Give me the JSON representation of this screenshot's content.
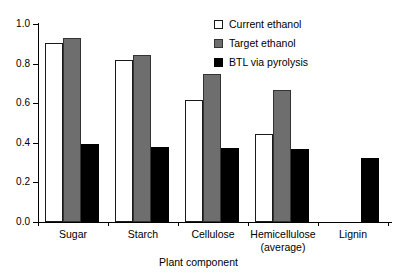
{
  "chart_data": {
    "type": "bar",
    "title": "",
    "xlabel": "Plant component",
    "ylabel": "",
    "ylim": [
      0.0,
      1.0
    ],
    "yticks": [
      "0.0",
      "0.2",
      "0.4",
      "0.6",
      "0.8",
      "1.0"
    ],
    "ytick_values": [
      0.0,
      0.2,
      0.4,
      0.6,
      0.8,
      1.0
    ],
    "grid": false,
    "legend_position": "top-right",
    "categories": [
      "Sugar",
      "Starch",
      "Cellulose",
      "Hemicellulose",
      "Lignin"
    ],
    "category_sublabels": [
      "",
      "",
      "",
      "(average)",
      ""
    ],
    "series": [
      {
        "name": "Current ethanol",
        "color": "#ffffff",
        "values": [
          0.905,
          0.82,
          0.615,
          0.445,
          null
        ]
      },
      {
        "name": "Target ethanol",
        "color": "#6e6e6e",
        "values": [
          0.93,
          0.845,
          0.75,
          0.665,
          null
        ]
      },
      {
        "name": "BTL via pyrolysis",
        "color": "#000000",
        "values": [
          0.395,
          0.38,
          0.375,
          0.37,
          0.325
        ]
      }
    ]
  },
  "legend": {
    "items": [
      {
        "label": "Current ethanol",
        "swatch": "legend-swatch-white"
      },
      {
        "label": "Target ethanol",
        "swatch": "legend-swatch-gray"
      },
      {
        "label": "BTL via pyrolysis",
        "swatch": "legend-swatch-black"
      }
    ]
  },
  "axes": {
    "x_title": "Plant component"
  }
}
